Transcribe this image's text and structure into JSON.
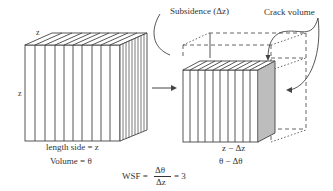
{
  "diagram": {
    "colors": {
      "stroke": "#444444",
      "text": "#333333",
      "background": "#ffffff"
    },
    "left_block": {
      "top_edge_label": "z",
      "side_edge_label": "z",
      "caption_line1": "length side = z",
      "caption_line2": "Volume = θ"
    },
    "transition_arrow": {
      "icon": "arrow-right-icon"
    },
    "right_block": {
      "callout_subsidence": "Subsidence (Δz)",
      "callout_crack": "Crack volume",
      "caption_line1": "z − Δz",
      "caption_line2": "θ − Δθ"
    },
    "formula": {
      "lhs": "WSF =",
      "numerator": "Δθ",
      "denominator": "Δz",
      "rhs": "= 3"
    }
  }
}
